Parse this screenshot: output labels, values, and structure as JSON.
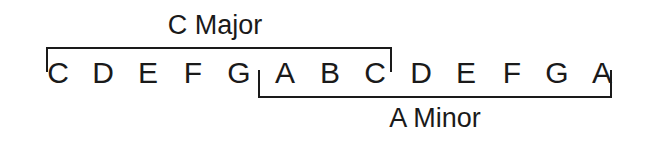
{
  "diagram": {
    "title_major": "C Major",
    "title_minor": "A Minor",
    "notes": [
      {
        "label": "C",
        "x": 58
      },
      {
        "label": "D",
        "x": 103
      },
      {
        "label": "E",
        "x": 148
      },
      {
        "label": "F",
        "x": 193
      },
      {
        "label": "G",
        "x": 239
      },
      {
        "label": "A",
        "x": 285
      },
      {
        "label": "B",
        "x": 330
      },
      {
        "label": "C",
        "x": 375
      },
      {
        "label": "D",
        "x": 421
      },
      {
        "label": "E",
        "x": 466
      },
      {
        "label": "F",
        "x": 512
      },
      {
        "label": "G",
        "x": 557
      },
      {
        "label": "A",
        "x": 602
      }
    ],
    "brackets": {
      "c_major": {
        "name": "C Major",
        "left": 46,
        "right": 392,
        "line_y": 47,
        "tick_length": 25,
        "tick_direction": "down",
        "covers_notes": "C D E F G A B C"
      },
      "a_minor": {
        "name": "A Minor",
        "left": 258,
        "right": 612,
        "line_y": 98,
        "tick_length": 28,
        "tick_direction": "up",
        "covers_notes": "A B C D E F G A"
      }
    },
    "colors": {
      "ink": "#1a1a1a",
      "background": "#ffffff"
    }
  }
}
